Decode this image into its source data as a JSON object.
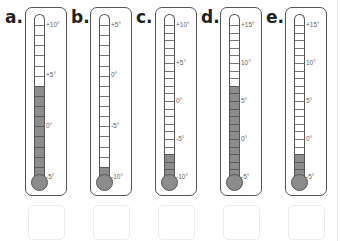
{
  "colors": {
    "outline": "#555555",
    "mercury": "#8c8c8c",
    "tick": "#777777",
    "label": "#666666",
    "answer_box_border": "#ececec"
  },
  "thermometers": [
    {
      "id": "a",
      "label": "a.",
      "max": 10,
      "min": -5,
      "reading": 4,
      "scale_labels": [
        "+10°",
        "+5°",
        "0°",
        "-5°"
      ],
      "scale_values": [
        10,
        5,
        0,
        -5
      ]
    },
    {
      "id": "b",
      "label": "b.",
      "max": 5,
      "min": -10,
      "reading": -9,
      "scale_labels": [
        "+5°",
        "0°",
        "-5°",
        "-10°"
      ],
      "scale_values": [
        5,
        0,
        -5,
        -10
      ]
    },
    {
      "id": "c",
      "label": "c.",
      "max": 10,
      "min": -10,
      "reading": -7,
      "scale_labels": [
        "+10°",
        "+5°",
        "0°",
        "-5°",
        "-10°"
      ],
      "scale_values": [
        10,
        5,
        0,
        -5,
        -10
      ]
    },
    {
      "id": "d",
      "label": "d.",
      "max": 15,
      "min": -5,
      "reading": 7,
      "scale_labels": [
        "+15°",
        "10°",
        "5°",
        "0°",
        "-5°"
      ],
      "scale_values": [
        15,
        10,
        5,
        0,
        -5
      ]
    },
    {
      "id": "e",
      "label": "e.",
      "max": 15,
      "min": -5,
      "reading": -2,
      "scale_labels": [
        "+15°",
        "10°",
        "5°",
        "0°",
        "-5°"
      ],
      "scale_values": [
        15,
        10,
        5,
        0,
        -5
      ]
    }
  ],
  "answer_boxes": [
    "",
    "",
    "",
    "",
    ""
  ]
}
